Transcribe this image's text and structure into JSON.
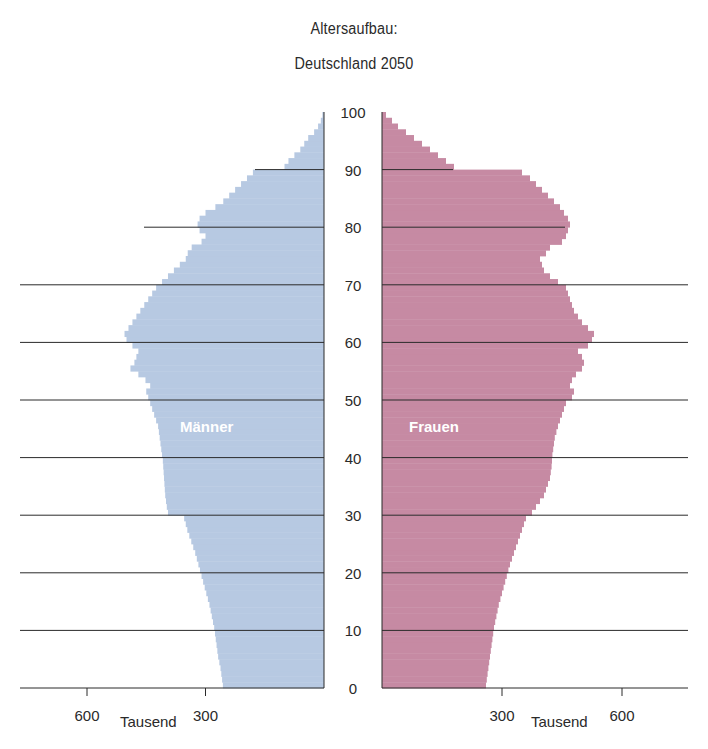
{
  "title": "Altersaufbau:",
  "subtitle": "Deutschland 2050",
  "labels": {
    "male": "Männer",
    "female": "Frauen",
    "unit_left": "Tausend",
    "unit_right": "Tausend"
  },
  "colors": {
    "male": "#b7c9e2",
    "female": "#c68aa3",
    "axis": "#2a2a2a",
    "grid": "#2a2a2a"
  },
  "chart_data": {
    "type": "bar",
    "subtype": "population-pyramid",
    "xlabel": "Tausend",
    "ylabel": "Alter",
    "y_ticks": [
      0,
      10,
      20,
      30,
      40,
      50,
      60,
      70,
      80,
      90,
      100
    ],
    "x_ticks": [
      300,
      600
    ],
    "xlim": [
      0,
      780
    ],
    "ylim": [
      0,
      100
    ],
    "grid": "horizontal lines every 10 years",
    "ages": [
      0,
      1,
      2,
      3,
      4,
      5,
      6,
      7,
      8,
      9,
      10,
      11,
      12,
      13,
      14,
      15,
      16,
      17,
      18,
      19,
      20,
      21,
      22,
      23,
      24,
      25,
      26,
      27,
      28,
      29,
      30,
      31,
      32,
      33,
      34,
      35,
      36,
      37,
      38,
      39,
      40,
      41,
      42,
      43,
      44,
      45,
      46,
      47,
      48,
      49,
      50,
      51,
      52,
      53,
      54,
      55,
      56,
      57,
      58,
      59,
      60,
      61,
      62,
      63,
      64,
      65,
      66,
      67,
      68,
      69,
      70,
      71,
      72,
      73,
      74,
      75,
      76,
      77,
      78,
      79,
      80,
      81,
      82,
      83,
      84,
      85,
      86,
      87,
      88,
      89,
      90,
      91,
      92,
      93,
      94,
      95,
      96,
      97,
      98,
      99
    ],
    "series": [
      {
        "name": "Männer",
        "values": [
          256,
          258,
          260,
          262,
          265,
          268,
          270,
          272,
          274,
          276,
          278,
          281,
          284,
          287,
          290,
          294,
          298,
          302,
          306,
          310,
          314,
          318,
          322,
          326,
          331,
          336,
          341,
          346,
          350,
          354,
          395,
          398,
          400,
          402,
          403,
          404,
          405,
          406,
          407,
          408,
          410,
          412,
          414,
          416,
          418,
          420,
          425,
          430,
          435,
          440,
          445,
          450,
          440,
          452,
          470,
          490,
          480,
          475,
          470,
          485,
          500,
          505,
          495,
          485,
          475,
          465,
          455,
          445,
          435,
          425,
          410,
          395,
          380,
          365,
          350,
          345,
          335,
          310,
          300,
          315,
          320,
          315,
          300,
          275,
          255,
          240,
          225,
          210,
          195,
          180,
          100,
          90,
          75,
          60,
          50,
          40,
          25,
          15,
          8,
          4
        ]
      },
      {
        "name": "Frauen",
        "values": [
          260,
          262,
          264,
          266,
          268,
          270,
          272,
          274,
          276,
          278,
          280,
          283,
          286,
          289,
          292,
          296,
          300,
          304,
          308,
          312,
          316,
          320,
          325,
          330,
          335,
          340,
          345,
          350,
          355,
          360,
          375,
          385,
          395,
          405,
          410,
          415,
          420,
          422,
          424,
          425,
          426,
          428,
          430,
          432,
          436,
          440,
          445,
          450,
          455,
          460,
          475,
          480,
          470,
          475,
          485,
          500,
          505,
          500,
          490,
          515,
          525,
          530,
          515,
          500,
          490,
          480,
          475,
          470,
          465,
          460,
          440,
          420,
          405,
          400,
          395,
          410,
          420,
          450,
          460,
          465,
          470,
          465,
          455,
          445,
          430,
          415,
          400,
          385,
          370,
          350,
          180,
          160,
          140,
          120,
          100,
          80,
          60,
          40,
          25,
          10
        ]
      }
    ]
  }
}
